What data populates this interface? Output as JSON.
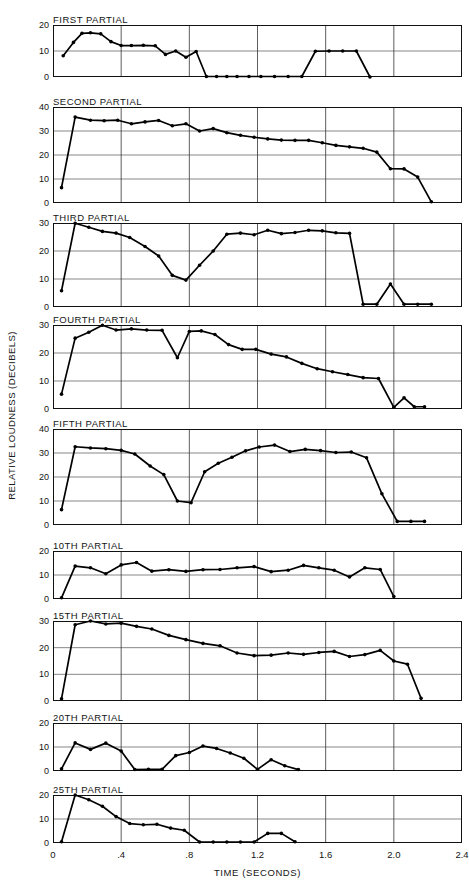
{
  "figure": {
    "ylabel": "RELATIVE LOUDNESS (DECIBELS)",
    "xlabel": "TIME (SECONDS)",
    "xticks": [
      "0",
      ".4",
      ".8",
      "1.2",
      "1.6",
      "2.0",
      "2.4"
    ]
  },
  "chart_data": {
    "type": "line",
    "title": "",
    "xlabel": "TIME (SECONDS)",
    "ylabel": "RELATIVE LOUDNESS (DECIBELS)",
    "xlim": [
      0,
      2.4
    ],
    "xticks": [
      0,
      0.4,
      0.8,
      1.2,
      1.6,
      2.0,
      2.4
    ],
    "grid": "vertical gridlines at every 0.4 s; horizontal gridlines at every labeled y tick",
    "legend": "none",
    "panels": [
      {
        "label": "FIRST PARTIAL",
        "ylim": [
          0,
          20
        ],
        "yticks": [
          0,
          10,
          20
        ],
        "x": [
          0.06,
          0.12,
          0.17,
          0.22,
          0.28,
          0.34,
          0.4,
          0.46,
          0.53,
          0.6,
          0.66,
          0.72,
          0.78,
          0.84,
          0.9,
          0.96,
          1.02,
          1.08,
          1.15,
          1.22,
          1.3,
          1.38,
          1.46,
          1.54,
          1.62,
          1.7,
          1.78,
          1.86
        ],
        "y": [
          8.2,
          13.3,
          16.8,
          17.0,
          16.6,
          13.6,
          12.1,
          12.1,
          12.2,
          12.0,
          8.7,
          10.0,
          7.6,
          9.8,
          0.2,
          0.2,
          0.2,
          0.2,
          0.2,
          0.2,
          0.2,
          0.2,
          0.2,
          9.9,
          10.0,
          10.0,
          10.0,
          0.0
        ]
      },
      {
        "label": "SECOND PARTIAL",
        "ylim": [
          0,
          40
        ],
        "yticks": [
          0,
          10,
          20,
          30,
          40
        ],
        "x": [
          0.05,
          0.13,
          0.22,
          0.3,
          0.38,
          0.46,
          0.54,
          0.62,
          0.7,
          0.78,
          0.86,
          0.94,
          1.02,
          1.1,
          1.18,
          1.26,
          1.34,
          1.42,
          1.5,
          1.58,
          1.66,
          1.74,
          1.82,
          1.9,
          1.98,
          2.06,
          2.14,
          2.22
        ],
        "y": [
          6.4,
          35.8,
          34.5,
          34.3,
          34.5,
          33.0,
          33.8,
          34.4,
          32.2,
          33.0,
          30.0,
          31.0,
          29.3,
          28.2,
          27.4,
          26.7,
          26.2,
          26.1,
          26.1,
          25.1,
          24.0,
          23.4,
          22.8,
          21.2,
          14.3,
          14.2,
          10.8,
          0.5
        ]
      },
      {
        "label": "THIRD PARTIAL",
        "ylim": [
          0,
          30
        ],
        "yticks": [
          0,
          10,
          20,
          30
        ],
        "x": [
          0.05,
          0.13,
          0.21,
          0.29,
          0.37,
          0.45,
          0.54,
          0.62,
          0.7,
          0.78,
          0.86,
          0.94,
          1.02,
          1.1,
          1.18,
          1.26,
          1.34,
          1.42,
          1.5,
          1.58,
          1.66,
          1.74,
          1.82,
          1.9,
          1.98,
          2.06,
          2.14,
          2.22
        ],
        "y": [
          5.8,
          29.9,
          28.5,
          27.0,
          26.4,
          24.8,
          21.6,
          18.2,
          11.3,
          9.6,
          14.9,
          20.0,
          26.0,
          26.4,
          25.8,
          27.4,
          26.2,
          26.6,
          27.4,
          27.2,
          26.5,
          26.3,
          1.0,
          1.0,
          8.2,
          1.0,
          1.0,
          1.0
        ]
      },
      {
        "label": "FOURTH PARTIAL",
        "ylim": [
          0,
          30
        ],
        "yticks": [
          0,
          10,
          20,
          30
        ],
        "x": [
          0.05,
          0.13,
          0.21,
          0.29,
          0.37,
          0.46,
          0.55,
          0.64,
          0.73,
          0.8,
          0.87,
          0.95,
          1.03,
          1.11,
          1.19,
          1.28,
          1.37,
          1.46,
          1.55,
          1.64,
          1.73,
          1.82,
          1.91,
          2.0,
          2.06,
          2.12,
          2.18
        ],
        "y": [
          5.3,
          25.3,
          27.4,
          29.9,
          28.2,
          28.6,
          28.2,
          28.1,
          18.3,
          27.7,
          27.9,
          26.6,
          23.0,
          21.3,
          21.3,
          19.6,
          18.6,
          16.3,
          14.4,
          13.3,
          12.3,
          11.2,
          10.9,
          0.6,
          4.0,
          0.8,
          0.8
        ]
      },
      {
        "label": "FIFTH PARTIAL",
        "ylim": [
          0,
          40
        ],
        "yticks": [
          0,
          10,
          20,
          30,
          40
        ],
        "x": [
          0.05,
          0.13,
          0.22,
          0.31,
          0.4,
          0.48,
          0.57,
          0.65,
          0.73,
          0.81,
          0.89,
          0.97,
          1.05,
          1.13,
          1.21,
          1.3,
          1.39,
          1.48,
          1.57,
          1.66,
          1.75,
          1.84,
          1.93,
          2.02,
          2.1,
          2.18
        ],
        "y": [
          6.4,
          32.6,
          32.1,
          31.8,
          31.1,
          29.6,
          24.6,
          21.0,
          10.0,
          9.3,
          22.2,
          25.7,
          28.2,
          30.9,
          32.5,
          33.3,
          30.6,
          31.5,
          31.0,
          30.2,
          30.4,
          28.0,
          13.0,
          1.5,
          1.5,
          1.5
        ]
      },
      {
        "label": "10TH PARTIAL",
        "ylim": [
          0,
          20
        ],
        "yticks": [
          0,
          10,
          20
        ],
        "x": [
          0.05,
          0.13,
          0.22,
          0.31,
          0.4,
          0.49,
          0.58,
          0.68,
          0.78,
          0.88,
          0.98,
          1.08,
          1.18,
          1.28,
          1.38,
          1.47,
          1.56,
          1.65,
          1.74,
          1.83,
          1.92,
          2.0
        ],
        "y": [
          0.5,
          13.7,
          13.0,
          10.5,
          14.2,
          15.2,
          11.6,
          12.2,
          11.5,
          12.2,
          12.3,
          13.0,
          13.5,
          11.4,
          12.0,
          14.0,
          13.0,
          12.0,
          9.2,
          13.0,
          12.3,
          1.0
        ]
      },
      {
        "label": "15TH PARTIAL",
        "ylim": [
          0,
          30
        ],
        "yticks": [
          0,
          10,
          20,
          30
        ],
        "x": [
          0.05,
          0.13,
          0.22,
          0.31,
          0.4,
          0.49,
          0.58,
          0.68,
          0.78,
          0.88,
          0.98,
          1.08,
          1.18,
          1.28,
          1.38,
          1.47,
          1.56,
          1.65,
          1.74,
          1.83,
          1.92,
          2.0,
          2.08,
          2.16
        ],
        "y": [
          0.8,
          28.6,
          30.0,
          28.9,
          29.2,
          28.0,
          27.0,
          24.6,
          23.0,
          21.6,
          20.7,
          18.0,
          17.0,
          17.2,
          18.0,
          17.5,
          18.2,
          18.6,
          16.7,
          17.4,
          19.0,
          15.0,
          13.8,
          1.0
        ]
      },
      {
        "label": "20TH PARTIAL",
        "ylim": [
          0,
          20
        ],
        "yticks": [
          0,
          10,
          20
        ],
        "x": [
          0.05,
          0.13,
          0.22,
          0.31,
          0.4,
          0.48,
          0.56,
          0.64,
          0.72,
          0.8,
          0.88,
          0.96,
          1.04,
          1.12,
          1.2,
          1.28,
          1.36,
          1.44
        ],
        "y": [
          0.9,
          11.7,
          9.0,
          11.6,
          8.3,
          0.6,
          0.7,
          0.7,
          6.4,
          7.7,
          10.4,
          9.4,
          7.5,
          5.3,
          0.7,
          4.7,
          2.2,
          0.6
        ]
      },
      {
        "label": "25TH PARTIAL",
        "ylim": [
          0,
          20
        ],
        "yticks": [
          0,
          10,
          20
        ],
        "x": [
          0.05,
          0.13,
          0.21,
          0.29,
          0.37,
          0.45,
          0.53,
          0.61,
          0.69,
          0.77,
          0.86,
          0.94,
          1.02,
          1.1,
          1.18,
          1.26,
          1.34,
          1.42
        ],
        "y": [
          0.5,
          20.0,
          18.0,
          15.3,
          11.0,
          8.1,
          7.6,
          7.8,
          6.2,
          5.3,
          0.4,
          0.4,
          0.4,
          0.4,
          0.4,
          4.0,
          4.0,
          0.5
        ]
      }
    ]
  }
}
